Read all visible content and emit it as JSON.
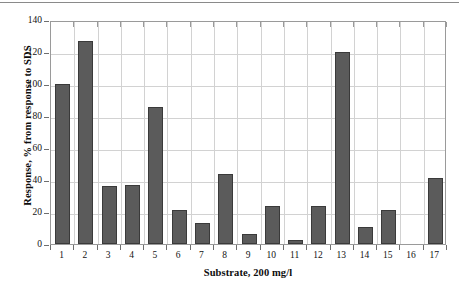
{
  "chart_data": {
    "type": "bar",
    "title": "",
    "xlabel": "Substrate, 200 mg/l",
    "ylabel": "Response, % from response to SDS",
    "categories": [
      "1",
      "2",
      "3",
      "4",
      "5",
      "6",
      "7",
      "8",
      "9",
      "10",
      "11",
      "12",
      "13",
      "14",
      "15",
      "16",
      "17"
    ],
    "values": [
      100,
      127,
      36,
      37,
      85.5,
      21,
      13,
      43.5,
      6,
      23.5,
      2.5,
      23.5,
      120,
      10.5,
      21,
      0,
      41
    ],
    "series": [
      {
        "name": "Response",
        "values": [
          100,
          127,
          36,
          37,
          85.5,
          21,
          13,
          43.5,
          6,
          23.5,
          2.5,
          23.5,
          120,
          10.5,
          21,
          0,
          41
        ]
      }
    ],
    "ylim": [
      0,
      140
    ],
    "ytick_values": [
      0,
      20,
      40,
      60,
      80,
      100,
      120,
      140
    ],
    "ytick_labels": [
      "0",
      "20",
      "40",
      "60",
      "80",
      "100",
      "120",
      "140"
    ],
    "xtick_labels": [
      "1",
      "2",
      "3",
      "4",
      "5",
      "6",
      "7",
      "8",
      "9",
      "10",
      "11",
      "12",
      "13",
      "14",
      "15",
      "16",
      "17"
    ],
    "grid": true,
    "grid_axis": "both",
    "legend": false,
    "legend_position": "none",
    "bar_color": "#5b5b5b",
    "bar_edge_color": "#3a3a3a",
    "grid_color": "#d2d2d2",
    "axis_color": "#9a9a9a",
    "background_color": "#ffffff",
    "text_color": "#111111"
  },
  "figure": {
    "top_rule_color": "#8a8a8a"
  }
}
